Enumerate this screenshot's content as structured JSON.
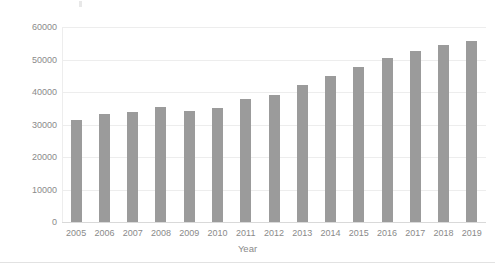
{
  "chart_data": {
    "type": "bar",
    "title": "",
    "xlabel": "Year",
    "ylabel": "Expenditure in Million GBP",
    "categories": [
      "2005",
      "2006",
      "2007",
      "2008",
      "2009",
      "2010",
      "2011",
      "2012",
      "2013",
      "2014",
      "2015",
      "2016",
      "2017",
      "2018",
      "2019"
    ],
    "values": [
      31400,
      33100,
      33900,
      35300,
      34300,
      35100,
      37900,
      39200,
      42100,
      45000,
      47800,
      50600,
      52500,
      54400,
      55600
    ],
    "series": [
      {
        "name": "Expenditure",
        "values": [
          31400,
          33100,
          33900,
          35300,
          34300,
          35100,
          37900,
          39200,
          42100,
          45000,
          47800,
          50600,
          52500,
          54400,
          55600
        ]
      }
    ],
    "ylim": [
      0,
      60000
    ],
    "yticks": [
      0,
      10000,
      20000,
      30000,
      40000,
      50000,
      60000
    ],
    "ytick_labels": [
      "0",
      "10000",
      "20000",
      "30000",
      "40000",
      "50000",
      "60000"
    ],
    "grid": true,
    "legend": false,
    "bar_color": "#9b9b9b",
    "gridline_color": "#ededed",
    "axis_color": "#d9d9d9",
    "text_color": "#8a8a8a",
    "background": "#ffffff"
  }
}
